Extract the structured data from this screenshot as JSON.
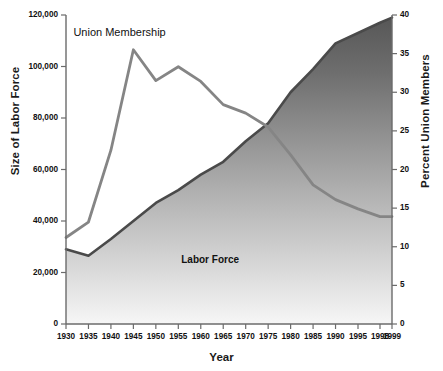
{
  "chart_data": {
    "type": "line",
    "title": "",
    "xlabel": "Year",
    "ylabel": "Size of Labor Force",
    "ylabel_right": "Percent Union Members",
    "grid": false,
    "legend": "inline-annotations",
    "x": [
      1930,
      1935,
      1940,
      1945,
      1950,
      1955,
      1960,
      1965,
      1970,
      1975,
      1980,
      1985,
      1990,
      1995,
      1998,
      1999
    ],
    "xtick_labels": [
      "1930",
      "1935",
      "1940",
      "1945",
      "1950",
      "1955",
      "1960",
      "1965",
      "1970",
      "1975",
      "1980",
      "1985",
      "1990",
      "1995",
      "1998",
      "1999"
    ],
    "left_axis": {
      "label": "Size of Labor Force",
      "ylim": [
        0,
        120000
      ],
      "ticks": [
        0,
        20000,
        40000,
        60000,
        80000,
        100000,
        120000
      ],
      "tick_labels": [
        "0",
        "20,000",
        "40,000",
        "60,000",
        "80,000",
        "100,000",
        "120,000"
      ]
    },
    "right_axis": {
      "label": "Percent Union Members",
      "ylim": [
        0,
        40
      ],
      "ticks": [
        0,
        5,
        10,
        15,
        20,
        25,
        30,
        35,
        40
      ],
      "tick_labels": [
        "0",
        "5",
        "10",
        "15",
        "20",
        "25",
        "30",
        "35",
        "40"
      ]
    },
    "series": [
      {
        "name": "Labor Force",
        "axis": "left",
        "units": "thousands of workers",
        "color": "#4d4d4d",
        "filled": true,
        "values": [
          29000,
          26500,
          33000,
          40000,
          47000,
          52000,
          58000,
          63000,
          71000,
          78000,
          90000,
          99000,
          109000,
          113000,
          117000,
          119000
        ]
      },
      {
        "name": "Union Membership",
        "axis": "right",
        "units": "percent of labor force",
        "color": "#808080",
        "filled": false,
        "values": [
          11.2,
          13.2,
          22.5,
          35.5,
          31.5,
          33.3,
          31.4,
          28.4,
          27.3,
          25.5,
          21.9,
          18.0,
          16.1,
          14.9,
          13.9,
          13.9
        ]
      }
    ],
    "annotations": [
      {
        "name": "union-membership-label",
        "text": "Union Membership",
        "x": 1941,
        "y_right": 37.5
      },
      {
        "name": "labor-force-label",
        "text": "Labor Force",
        "x": 1965,
        "y_left": 24000
      }
    ],
    "colors": {
      "fill_top": "#585858",
      "fill_bottom": "#f4f4f4",
      "labor_force_line": "#4a4a4a",
      "union_line": "#858585",
      "axis": "#6b6b6b",
      "text": "#111111"
    }
  }
}
